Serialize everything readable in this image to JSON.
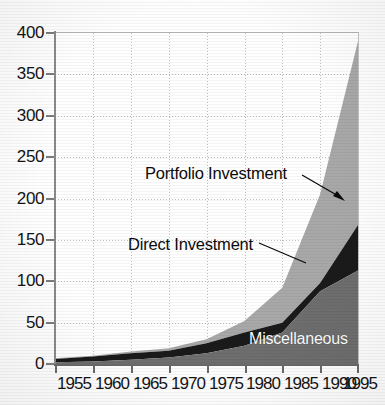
{
  "chart_data": {
    "type": "area",
    "stacked": true,
    "title": "",
    "subtitle": "",
    "xlabel": "",
    "ylabel": "",
    "xlim": [
      1955,
      1995
    ],
    "ylim": [
      0,
      400
    ],
    "grid": true,
    "legend_position": "inline-annotations",
    "x": [
      1955,
      1960,
      1965,
      1970,
      1975,
      1980,
      1985,
      1990,
      1995
    ],
    "xticks": [
      "1955",
      "1960",
      "1965",
      "1970",
      "1975",
      "1980",
      "1985",
      "1990",
      "1995"
    ],
    "yticks": [
      "0",
      "50",
      "100",
      "150",
      "200",
      "250",
      "300",
      "350",
      "400"
    ],
    "series": [
      {
        "name": "Miscellaneous",
        "color": "#6e6e6e",
        "label_color": "#ffffff",
        "values": [
          2,
          3,
          5,
          8,
          13,
          22,
          38,
          88,
          113
        ]
      },
      {
        "name": "Direct Investment",
        "color": "#1a1a1a",
        "label_color": "#0b0b0b",
        "values": [
          6,
          9,
          13,
          16,
          25,
          38,
          50,
          98,
          168
        ]
      },
      {
        "name": "Portfolio Investment",
        "color": "#a8a8a8",
        "label_color": "#0b0b0b",
        "values": [
          7,
          10,
          15,
          19,
          30,
          52,
          92,
          205,
          390
        ]
      }
    ],
    "cumulative_note": "Series values are cumulative stack tops: Miscellaneous is the bottom band, Direct Investment band top, Portfolio Investment band top (grand total).",
    "annotations": [
      {
        "text": "Portfolio Investment",
        "x": 1974,
        "y": 230,
        "arrow": true
      },
      {
        "text": "Direct Investment",
        "x": 1972,
        "y": 140,
        "arrow": false
      },
      {
        "text": "Miscellaneous",
        "x": 1988,
        "y": 25,
        "arrow": false
      }
    ]
  },
  "axes": {
    "y_labels": [
      "400",
      "350",
      "300",
      "250",
      "200",
      "150",
      "100",
      "50",
      "0"
    ],
    "x_labels": [
      "1955",
      "1960",
      "1965",
      "1970",
      "1975",
      "1980",
      "1985",
      "1990",
      "1995"
    ]
  },
  "labels": {
    "portfolio": "Portfolio Investment",
    "direct": "Direct Investment",
    "miscellaneous": "Miscellaneous"
  },
  "colors": {
    "portfolio": "#a8a8a8",
    "direct": "#1a1a1a",
    "miscellaneous": "#6e6e6e",
    "grid": "#bdbdbd",
    "axis": "#6a6a6a",
    "text": "#141414",
    "background": "#ffffff"
  }
}
